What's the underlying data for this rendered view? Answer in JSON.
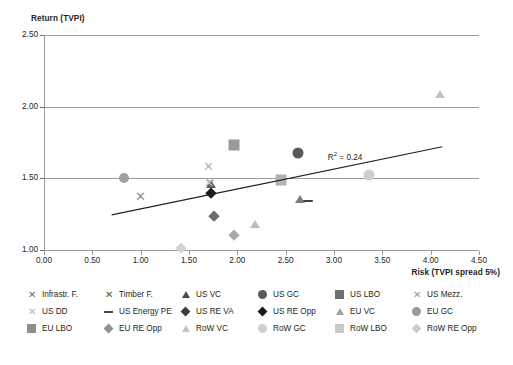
{
  "chart_data": {
    "type": "scatter",
    "title": "",
    "ylabel": "Return (TVPI)",
    "xlabel": "Risk (TVPI spread 5%)",
    "xlim": [
      0.0,
      4.5
    ],
    "ylim": [
      1.0,
      2.5
    ],
    "xticks": [
      "0.00",
      "0.50",
      "1.00",
      "1.50",
      "2.00",
      "2.50",
      "3.00",
      "3.50",
      "4.00",
      "4.50"
    ],
    "yticks": [
      "1.00",
      "1.50",
      "2.00",
      "2.50"
    ],
    "grid": "horizontal",
    "legend_position": "bottom",
    "annotations": [
      {
        "text": "R² = 0.24",
        "x": 3.35,
        "y": 1.655
      }
    ],
    "trendline": {
      "x0": 0.7,
      "y0": 1.245,
      "x1": 4.12,
      "y1": 1.72,
      "r2": 0.24
    },
    "points": [
      {
        "name": "Infrastr. F.",
        "x": 1.72,
        "y": 1.465,
        "shape": "x",
        "color": "#6e6e6e",
        "size": 11
      },
      {
        "name": "Timber F.",
        "x": 1.0,
        "y": 1.375,
        "shape": "x",
        "color": "#8c8c8c",
        "size": 12
      },
      {
        "name": "US VC",
        "x": 1.73,
        "y": 1.455,
        "shape": "triangle",
        "color": "#5f5f5f",
        "size": 10
      },
      {
        "name": "US GC",
        "x": 2.63,
        "y": 1.675,
        "shape": "circle",
        "color": "#595959",
        "size": 11
      },
      {
        "name": "US LBO",
        "x": 1.97,
        "y": 1.73,
        "shape": "square",
        "color": "#9a9a9a",
        "size": 11
      },
      {
        "name": "US Mezz.",
        "x": 1.7,
        "y": 1.585,
        "shape": "x",
        "color": "#b5b5b5",
        "size": 12
      },
      {
        "name": "US DD",
        "x": 1.71,
        "y": 1.47,
        "shape": "x",
        "color": "#c9c9c9",
        "size": 11
      },
      {
        "name": "US Energy PE",
        "x": 2.73,
        "y": 1.345,
        "shape": "dash",
        "color": "#3f3f3f",
        "size": 10
      },
      {
        "name": "US RE VA",
        "x": 1.76,
        "y": 1.24,
        "shape": "diamond",
        "color": "#6a6a6a",
        "size": 10
      },
      {
        "name": "US RE Opp",
        "x": 1.73,
        "y": 1.4,
        "shape": "diamond",
        "color": "#1a1a1a",
        "size": 10
      },
      {
        "name": "EU VC",
        "x": 2.65,
        "y": 1.35,
        "shape": "triangle",
        "color": "#7d7d7d",
        "size": 10
      },
      {
        "name": "EU GC",
        "x": 0.83,
        "y": 1.5,
        "shape": "circle",
        "color": "#a0a0a0",
        "size": 10
      },
      {
        "name": "EU LBO",
        "x": 2.45,
        "y": 1.49,
        "shape": "square",
        "color": "#b2b2b2",
        "size": 11
      },
      {
        "name": "EU RE Opp",
        "x": 1.97,
        "y": 1.105,
        "shape": "diamond",
        "color": "#a8a8a8",
        "size": 10
      },
      {
        "name": "RoW VC",
        "x": 4.1,
        "y": 2.08,
        "shape": "triangle",
        "color": "#c4c4c4",
        "size": 10
      },
      {
        "name": "RoW GC",
        "x": 3.36,
        "y": 1.525,
        "shape": "circle",
        "color": "#cfcfcf",
        "size": 11
      },
      {
        "name": "RoW LBO",
        "x": 2.18,
        "y": 1.175,
        "shape": "triangle",
        "color": "#bdbdbd",
        "size": 10
      },
      {
        "name": "RoW RE Opp",
        "x": 1.42,
        "y": 1.015,
        "shape": "diamond",
        "color": "#d4d4d4",
        "size": 10
      }
    ]
  },
  "legend": {
    "items": [
      {
        "label": "Infrastr. F.",
        "shape": "x",
        "color": "#6e6e6e"
      },
      {
        "label": "Timber F.",
        "shape": "x",
        "color": "#555555"
      },
      {
        "label": "US VC",
        "shape": "triangle",
        "color": "#4a4a4a"
      },
      {
        "label": "US GC",
        "shape": "circle",
        "color": "#5a5a5a"
      },
      {
        "label": "US LBO",
        "shape": "square",
        "color": "#6f6f6f"
      },
      {
        "label": "US Mezz.",
        "shape": "x",
        "color": "#949494"
      },
      {
        "label": "US DD",
        "shape": "x",
        "color": "#b5b5b5"
      },
      {
        "label": "US Energy PE",
        "shape": "dash",
        "color": "#4a4a4a"
      },
      {
        "label": "US RE VA",
        "shape": "diamond",
        "color": "#3d3d3d"
      },
      {
        "label": "US RE Opp",
        "shape": "diamond",
        "color": "#1a1a1a"
      },
      {
        "label": "EU VC",
        "shape": "triangle",
        "color": "#a0a0a0"
      },
      {
        "label": "EU GC",
        "shape": "circle",
        "color": "#9a9a9a"
      },
      {
        "label": "EU LBO",
        "shape": "square",
        "color": "#8e8e8e"
      },
      {
        "label": "EU RE Opp",
        "shape": "diamond",
        "color": "#8f8f8f"
      },
      {
        "label": "RoW VC",
        "shape": "triangle",
        "color": "#c4c4c4"
      },
      {
        "label": "RoW GC",
        "shape": "circle",
        "color": "#cfcfcf"
      },
      {
        "label": "RoW LBO",
        "shape": "square",
        "color": "#c9c9c9"
      },
      {
        "label": "RoW RE Opp",
        "shape": "diamond",
        "color": "#cccccc"
      }
    ]
  },
  "colors": {
    "grid": "#9b9b9b",
    "axis": "#9b9b9b",
    "text": "#231f20",
    "trendline": "#231f20",
    "background": "#ffffff"
  }
}
